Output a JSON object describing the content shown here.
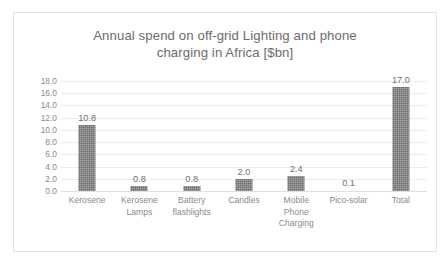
{
  "chart_data": {
    "type": "bar",
    "title": "Annual spend on off-grid Lighting and phone\ncharging in Africa [$bn]",
    "title_line1": "Annual spend on off-grid Lighting and phone",
    "title_line2": "charging in Africa [$bn]",
    "xlabel": "",
    "ylabel": "",
    "ylim": [
      0.0,
      18.0
    ],
    "ytick_step": 2.0,
    "yticks": [
      "18.0",
      "16.0",
      "14.0",
      "12.0",
      "10.0",
      "8.0",
      "6.0",
      "4.0",
      "2.0",
      "0.0"
    ],
    "ytick_values": [
      18.0,
      16.0,
      14.0,
      12.0,
      10.0,
      8.0,
      6.0,
      4.0,
      2.0,
      0.0
    ],
    "grid": true,
    "legend": "none",
    "categories": [
      "Kerosene",
      "Kerosene\nLamps",
      "Battery\nflashlights",
      "Candles",
      "Mobile\nPhone\nCharging",
      "Pico-solar",
      "Total"
    ],
    "values": [
      10.8,
      0.8,
      0.8,
      2.0,
      2.4,
      0.1,
      17.0
    ],
    "data_labels": [
      "10.8",
      "0.8",
      "0.8",
      "2.0",
      "2.4",
      "0.1",
      "17.0"
    ],
    "series": [
      {
        "name": "Annual spend [$bn]",
        "values": [
          10.8,
          0.8,
          0.8,
          2.0,
          2.4,
          0.1,
          17.0
        ]
      }
    ],
    "colors": {
      "bar": "#6e6e6e",
      "title_text": "#6c6c6c",
      "axis_text": "#8a8a8a",
      "gridline": "#ededed",
      "plot_background": "#ffffff",
      "frame_border": "#e2e2e2"
    }
  }
}
